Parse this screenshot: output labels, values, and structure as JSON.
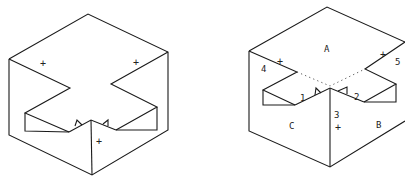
{
  "figures": [
    {
      "id": "left",
      "description": "Isometric cube with cross-shaped notch cut into the top face (unlabeled)",
      "markers": [
        "+",
        "+",
        "+"
      ]
    },
    {
      "id": "right",
      "description": "Same notched cube with labeled faces and edges",
      "face_labels": {
        "top": "A",
        "right": "B",
        "left": "C"
      },
      "edge_labels": [
        "1",
        "2",
        "3",
        "4",
        "5"
      ],
      "markers": [
        "+",
        "+",
        "+"
      ]
    }
  ],
  "colors": {
    "line": "#1a1a1a",
    "background": "#ffffff"
  }
}
